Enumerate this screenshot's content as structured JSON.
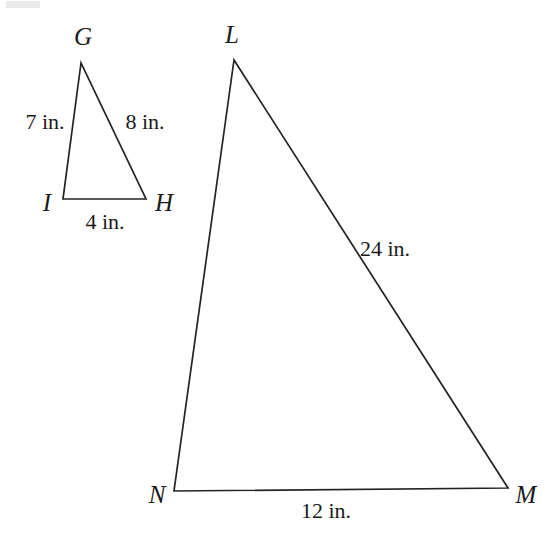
{
  "figure": {
    "type": "geometry-diagram",
    "background_color": "#ffffff",
    "stroke_color": "#232323",
    "text_color": "#1a1a1a",
    "units": "in.",
    "shapes": [
      {
        "id": "small-triangle",
        "name": "triangle-GIH",
        "vertices": [
          {
            "label": "G",
            "x": 81,
            "y": 63,
            "label_x": 83,
            "label_y": 45
          },
          {
            "label": "I",
            "x": 63,
            "y": 199,
            "label_x": 47,
            "label_y": 211
          },
          {
            "label": "H",
            "x": 146,
            "y": 199,
            "label_x": 164,
            "label_y": 211
          }
        ],
        "sides": [
          {
            "name": "GI",
            "label": "7 in.",
            "label_x": 45,
            "label_y": 129,
            "anchor": "middle"
          },
          {
            "name": "GH",
            "label": "8 in.",
            "label_x": 145,
            "label_y": 129,
            "anchor": "middle"
          },
          {
            "name": "IH",
            "label": "4 in.",
            "label_x": 105,
            "label_y": 229,
            "anchor": "middle"
          }
        ]
      },
      {
        "id": "large-triangle",
        "name": "triangle-LNM",
        "vertices": [
          {
            "label": "L",
            "x": 234,
            "y": 60,
            "label_x": 232,
            "label_y": 43
          },
          {
            "label": "N",
            "x": 174,
            "y": 491,
            "label_x": 157,
            "label_y": 503
          },
          {
            "label": "M",
            "x": 508,
            "y": 488,
            "label_x": 526,
            "label_y": 503
          }
        ],
        "sides": [
          {
            "name": "LM",
            "label": "24 in.",
            "label_x": 360,
            "label_y": 256,
            "anchor": "start"
          },
          {
            "name": "NM",
            "label": "12 in.",
            "label_x": 326,
            "label_y": 518,
            "anchor": "middle"
          },
          {
            "name": "LN",
            "label": "",
            "label_x": 0,
            "label_y": 0,
            "anchor": "middle"
          }
        ]
      }
    ]
  }
}
